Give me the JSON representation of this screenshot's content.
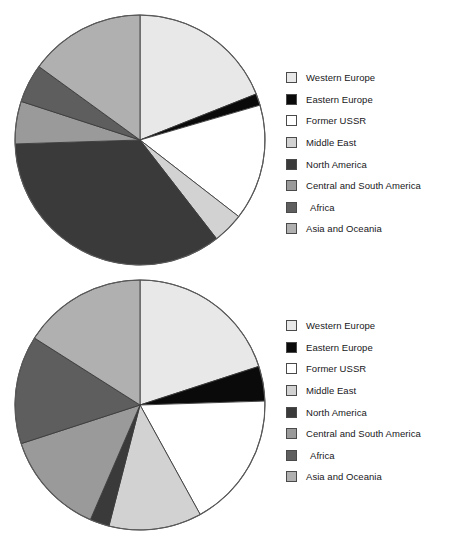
{
  "caption": {
    "top_text": ""
  },
  "legend": {
    "entries": [
      {
        "label": "Western Europe",
        "color": "#e8e8e8"
      },
      {
        "label": "Eastern Europe",
        "color": "#0a0a0a"
      },
      {
        "label": "Former USSR",
        "color": "#ffffff"
      },
      {
        "label": "Middle East",
        "color": "#d2d2d2"
      },
      {
        "label": "North America",
        "color": "#3a3a3a"
      },
      {
        "label": "Central and South America",
        "color": "#9a9a9a"
      },
      {
        "label": "Africa",
        "color": "#5e5e5e"
      },
      {
        "label": "Asia and Oceania",
        "color": "#b0b0b0"
      }
    ]
  },
  "chart_data": [
    {
      "type": "pie",
      "id": "pie-top",
      "title": "",
      "legend_position": "right",
      "start_angle_deg": 0,
      "direction": "clockwise",
      "categories": [
        "Western Europe",
        "Eastern Europe",
        "Former USSR",
        "Middle East",
        "North America",
        "Central and South America",
        "Africa",
        "Asia and Oceania"
      ],
      "values": [
        19.0,
        1.5,
        15.0,
        4.0,
        35.0,
        5.5,
        5.0,
        15.0
      ],
      "unit": "percent",
      "colors": [
        "#e8e8e8",
        "#0a0a0a",
        "#ffffff",
        "#d2d2d2",
        "#3a3a3a",
        "#9a9a9a",
        "#5e5e5e",
        "#b0b0b0"
      ]
    },
    {
      "type": "pie",
      "id": "pie-bottom",
      "title": "",
      "legend_position": "right",
      "start_angle_deg": 0,
      "direction": "clockwise",
      "categories": [
        "Western Europe",
        "Eastern Europe",
        "Former USSR",
        "Middle East",
        "North America",
        "Central and South America",
        "Africa",
        "Asia and Oceania"
      ],
      "values": [
        20.0,
        4.5,
        17.5,
        12.0,
        2.5,
        13.5,
        14.0,
        16.0
      ],
      "unit": "percent",
      "colors": [
        "#e8e8e8",
        "#0a0a0a",
        "#ffffff",
        "#d2d2d2",
        "#3a3a3a",
        "#9a9a9a",
        "#5e5e5e",
        "#b0b0b0"
      ]
    }
  ]
}
